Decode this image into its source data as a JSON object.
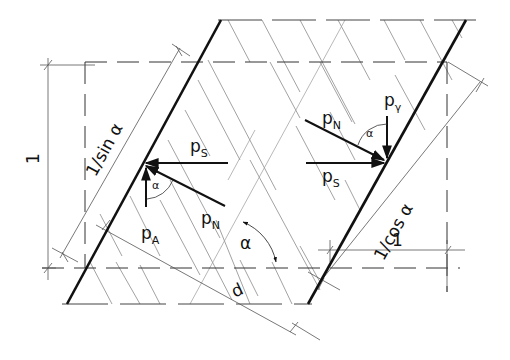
{
  "diagram": {
    "type": "technical force diagram (inclined wall slab with hatching)",
    "colors": {
      "ink": "#111111",
      "thin_line": "#555555",
      "hatch": "#777777",
      "background": "#ffffff"
    },
    "labels": {
      "dimension_vertical": "1",
      "dimension_slant_left": "1/sin α",
      "dimension_slant_right": "1/cos α",
      "dimension_horizontal": "1",
      "thickness": "d",
      "angle_main": "α",
      "angle_left": "α",
      "angle_right": "α"
    },
    "forces_left": {
      "p_s": {
        "base": "p",
        "sub": "S"
      },
      "p_n": {
        "base": "p",
        "sub": "N"
      },
      "p_a": {
        "base": "p",
        "sub": "A"
      }
    },
    "forces_right": {
      "p_n": {
        "base": "p",
        "sub": "N"
      },
      "p_s": {
        "base": "p",
        "sub": "S"
      },
      "p_gamma": {
        "base": "p",
        "sub": "γ"
      }
    }
  }
}
